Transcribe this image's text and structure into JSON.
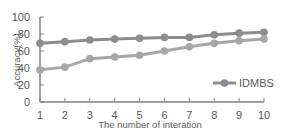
{
  "chart_data": {
    "type": "line",
    "title": "",
    "xlabel": "The number of interation",
    "ylabel": "Accuracy(%)",
    "x": [
      1,
      2,
      3,
      4,
      5,
      6,
      7,
      8,
      9,
      10
    ],
    "ylim": [
      0,
      100
    ],
    "yticks": [
      0,
      20,
      40,
      60,
      80,
      100
    ],
    "grid": false,
    "legend_position": "lower right",
    "series": [
      {
        "name": "",
        "color": "#8c8c8c",
        "values": [
          69,
          71,
          73,
          74,
          75,
          76,
          76,
          79,
          81,
          82
        ]
      },
      {
        "name": "IDMBS",
        "color": "#a6a6a6",
        "values": [
          38,
          41,
          51,
          53,
          55,
          60,
          65,
          69,
          72,
          74
        ]
      }
    ]
  },
  "legend": {
    "label": "IDMBS"
  }
}
